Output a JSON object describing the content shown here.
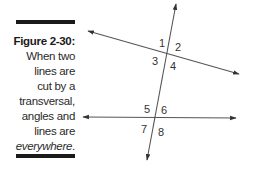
{
  "caption": {
    "figure_label": "Figure 2-30:",
    "lines": [
      "When two",
      "lines are",
      "cut by a",
      "transversal,",
      "angles and",
      "lines are"
    ],
    "emphasis": "everywhere",
    "trailing": "."
  },
  "diagram": {
    "angle_labels": [
      "1",
      "2",
      "3",
      "4",
      "5",
      "6",
      "7",
      "8"
    ],
    "line_color": "#555555"
  }
}
